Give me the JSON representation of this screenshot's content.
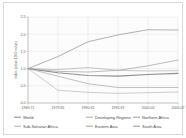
{
  "figure": {
    "background": "#ffffff",
    "frame_color": "#d8d8d8"
  },
  "chart_data": {
    "type": "line",
    "title": "",
    "xlabel": "",
    "ylabel": "Index (value 1969 value)",
    "ylim": [
      0.0,
      2.5
    ],
    "yticks": [
      "0.0",
      "0.5",
      "1.0",
      "1.5",
      "2.0",
      "2.5"
    ],
    "ytick_values": [
      0.0,
      0.5,
      1.0,
      1.5,
      2.0,
      2.5
    ],
    "grid": true,
    "legend_position": "below",
    "legend_columns": 3,
    "categories": [
      "1969-71",
      "1979-81",
      "1990-92",
      "1995-97",
      "2000-02",
      "2005-07"
    ],
    "series": [
      {
        "name": "World",
        "color": "#8f8f8f",
        "width": 1.15,
        "values": [
          1.0,
          0.88,
          0.8,
          0.78,
          0.83,
          0.86
        ]
      },
      {
        "name": "Developing Regions",
        "color": "#b0b0b0",
        "width": 0.7,
        "values": [
          1.0,
          0.97,
          1.03,
          0.95,
          0.93,
          0.94
        ]
      },
      {
        "name": "Northern Africa",
        "color": "#a3a3a3",
        "width": 0.85,
        "values": [
          1.0,
          1.35,
          1.78,
          1.98,
          2.13,
          2.12
        ]
      },
      {
        "name": "Sub-Saharan Africa",
        "color": "#b8b8b8",
        "width": 0.7,
        "values": [
          1.0,
          0.37,
          0.31,
          0.28,
          0.3,
          0.32
        ]
      },
      {
        "name": "Eastern Asia",
        "color": "#a8a8a8",
        "width": 0.7,
        "values": [
          1.0,
          0.78,
          0.56,
          0.45,
          0.45,
          0.45
        ]
      },
      {
        "name": "South Asia",
        "color": "#9e9e9e",
        "width": 0.7,
        "values": [
          1.0,
          0.92,
          0.9,
          0.95,
          1.08,
          1.25
        ]
      }
    ]
  },
  "legend": {
    "items": [
      {
        "label": "World",
        "color": "#8f8f8f"
      },
      {
        "label": "Developing Regions",
        "color": "#b0b0b0"
      },
      {
        "label": "Northern Africa",
        "color": "#a3a3a3"
      },
      {
        "label": "Sub-Saharan Africa",
        "color": "#b8b8b8"
      },
      {
        "label": "Eastern Asia",
        "color": "#a8a8a8"
      },
      {
        "label": "South Asia",
        "color": "#9e9e9e"
      }
    ]
  }
}
